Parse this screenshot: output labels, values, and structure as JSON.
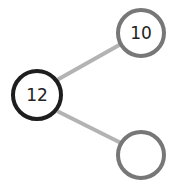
{
  "diagram": {
    "type": "number-bond",
    "colors": {
      "whole_stroke": "#1e1e1e",
      "part_stroke": "#777777",
      "line": "#b0b0b0"
    },
    "whole": {
      "label": "12"
    },
    "parts": [
      {
        "label": "10"
      },
      {
        "label": ""
      }
    ]
  }
}
